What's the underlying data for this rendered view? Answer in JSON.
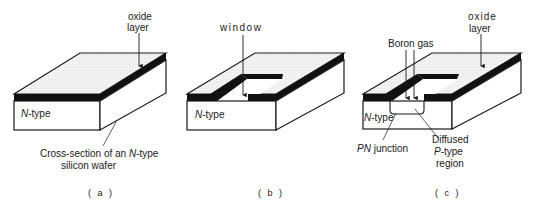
{
  "figure": {
    "panels": [
      {
        "id": "a",
        "caption": "( a )",
        "labels": {
          "oxide_line1": "oxide",
          "oxide_line2": "layer",
          "ntype_italic": "N",
          "ntype_rest": "-type",
          "cross_line1_a": "Cross-section of an ",
          "cross_line1_italic": "N",
          "cross_line1_b": "-type",
          "cross_line2": "silicon wafer"
        }
      },
      {
        "id": "b",
        "caption": "( b )",
        "labels": {
          "window": "window",
          "ntype_italic": "N",
          "ntype_rest": "-type"
        }
      },
      {
        "id": "c",
        "caption": "( c )",
        "labels": {
          "oxide_line1": "oxide",
          "oxide_line2": "layer",
          "boron": "Boron gas",
          "ntype_italic": "N",
          "ntype_rest": "-type",
          "pn_italic": "PN",
          "pn_rest": " junction",
          "diffused_line1": "Diffused",
          "diffused_line2_italic": "P",
          "diffused_line2_rest": "-type",
          "diffused_line3": "region"
        }
      }
    ],
    "colors": {
      "oxide": "#111111",
      "top_surface": "#ececec",
      "wafer": "#ffffff",
      "stroke": "#1a1a1a"
    }
  }
}
